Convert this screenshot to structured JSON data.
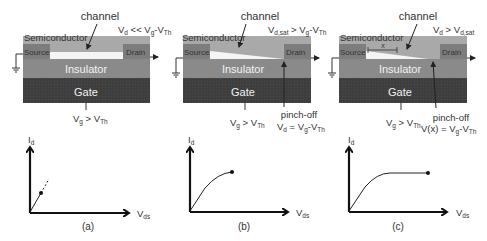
{
  "colors": {
    "semiconductor": "#a9a9a9",
    "source_drain": "#7d7d7d",
    "channel": "#f4f4f4",
    "insulator": "#8a8a8a",
    "gate": "#3e3e3e",
    "axis": "#111111",
    "text": "#333333"
  },
  "panels": [
    {
      "id": "a",
      "caption": "(a)",
      "channel_label": "channel",
      "semiconductor_label": "Semiconductor",
      "source_label": "Source",
      "drain_label": "Drain",
      "insulator_label": "Insulator",
      "gate_label": "Gate",
      "drain_condition": {
        "main": "V",
        "sub": "d",
        "rel": " << V",
        "sub2": "g",
        "minus": "-V",
        "sub3": "Th"
      },
      "gate_condition": {
        "main": "V",
        "sub": "g",
        "rel": " > V",
        "sub2": "Th"
      },
      "channel_shape": "uniform",
      "pinch_off": null,
      "graph": {
        "y_label": "I",
        "y_sub": "d",
        "x_label": "V",
        "x_sub": "ds",
        "curve": "linear-dashed"
      }
    },
    {
      "id": "b",
      "caption": "(b)",
      "channel_label": "channel",
      "semiconductor_label": "Semiconductor",
      "source_label": "Source",
      "drain_label": "Drain",
      "insulator_label": "Insulator",
      "gate_label": "Gate",
      "drain_condition": {
        "main": "V",
        "sub": "d,sat",
        "rel": " > V",
        "sub2": "g",
        "minus": "-V",
        "sub3": "Th"
      },
      "gate_condition": {
        "main": "V",
        "sub": "g",
        "rel": " > V",
        "sub2": "Th"
      },
      "channel_shape": "tapered-to-drain",
      "pinch_off": {
        "label": "pinch-off",
        "eq_main": "V",
        "eq_sub": "d",
        "eq_rel": " = V",
        "eq_sub2": "g",
        "eq_minus": "-V",
        "eq_sub3": "Th"
      },
      "graph": {
        "y_label": "I",
        "y_sub": "d",
        "x_label": "V",
        "x_sub": "ds",
        "curve": "knee"
      }
    },
    {
      "id": "c",
      "caption": "(c)",
      "channel_label": "channel",
      "semiconductor_label": "Semiconductor",
      "source_label": "Source",
      "drain_label": "Drain",
      "insulator_label": "Insulator",
      "gate_label": "Gate",
      "x_marker": "x",
      "drain_condition": {
        "main": "V",
        "sub": "d",
        "rel": " > V",
        "sub2": "d,sat"
      },
      "gate_condition": {
        "main": "V",
        "sub": "g",
        "rel": " > V",
        "sub2": "Th"
      },
      "channel_shape": "tapered-pinched",
      "pinch_off": {
        "label": "pinch-off",
        "eq_main": "V(x)",
        "eq_sub": "",
        "eq_rel": " = V",
        "eq_sub2": "g",
        "eq_minus": "-V",
        "eq_sub3": "Th"
      },
      "graph": {
        "y_label": "I",
        "y_sub": "d",
        "x_label": "V",
        "x_sub": "ds",
        "curve": "saturation"
      }
    }
  ]
}
